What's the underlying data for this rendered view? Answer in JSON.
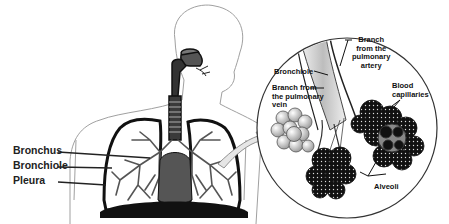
{
  "diagram": {
    "body_labels": [
      {
        "id": "bronchus",
        "text": "Bronchus"
      },
      {
        "id": "bronchiole",
        "text": "Bronchiole"
      },
      {
        "id": "pleura",
        "text": "Pleura"
      }
    ],
    "inset_labels": {
      "bronchiole": "Bronchiole",
      "artery_branch": [
        "Branch",
        "from the",
        "pulmonary",
        "artery"
      ],
      "vein_branch": [
        "Branch from",
        "the pulmonary",
        "vein"
      ],
      "capillaries": [
        "Blood",
        "capillaries"
      ],
      "alveoli": "Alveoli"
    },
    "colors": {
      "outline": "#111111",
      "body_outline": "#9a9a9a",
      "lung_tree": "#555555",
      "arrow_fill": "#e6e6e6"
    }
  }
}
